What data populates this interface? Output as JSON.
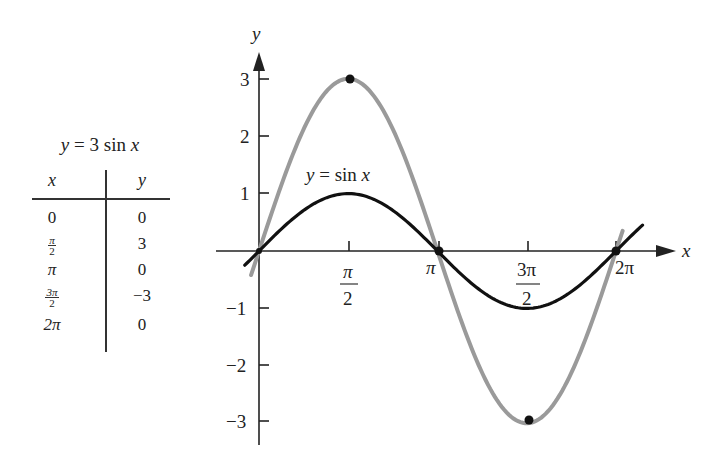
{
  "table": {
    "title": "y = 3 sin x",
    "headers": [
      "x",
      "y"
    ],
    "rows": [
      {
        "x": "0",
        "y": "0"
      },
      {
        "x_num": "π",
        "x_den": "2",
        "y": "3"
      },
      {
        "x": "π",
        "y": "0"
      },
      {
        "x_num": "3π",
        "x_den": "2",
        "y": "−3"
      },
      {
        "x": "2π",
        "y": "0"
      }
    ]
  },
  "graph": {
    "x_axis_label": "x",
    "y_axis_label": "y",
    "curve_label": "y = sin x",
    "x_ticks": [
      {
        "label": "π",
        "den": "2",
        "value": 1.5708
      },
      {
        "label": "π",
        "den": "",
        "value": 3.1416
      },
      {
        "label": "3π",
        "den": "2",
        "value": 4.7124
      },
      {
        "label": "2π",
        "den": "",
        "value": 6.2832
      }
    ],
    "y_ticks": [
      "3",
      "2",
      "1",
      "−1",
      "−2",
      "−3"
    ],
    "colors": {
      "sin": "#111111",
      "three_sin": "#9a9a9a",
      "axis": "#222222"
    }
  },
  "chart_data": {
    "type": "line",
    "title": "",
    "xlabel": "x",
    "ylabel": "y",
    "xlim": [
      -0.25,
      6.8
    ],
    "ylim": [
      -3.4,
      3.9
    ],
    "x_tick_labels": [
      "π/2",
      "π",
      "3π/2",
      "2π"
    ],
    "y_tick_labels": [
      "-3",
      "-2",
      "-1",
      "1",
      "2",
      "3"
    ],
    "grid": false,
    "legend": "none (inline label 'y = sin x')",
    "series": [
      {
        "name": "y = sin x",
        "color": "#111111",
        "x": [
          0,
          1.5708,
          3.1416,
          4.7124,
          6.2832
        ],
        "y": [
          0,
          1,
          0,
          -1,
          0
        ]
      },
      {
        "name": "y = 3 sin x",
        "color": "#9a9a9a",
        "x": [
          0,
          1.5708,
          3.1416,
          4.7124,
          6.2832
        ],
        "y": [
          0,
          3,
          0,
          -3,
          0
        ]
      }
    ],
    "marked_points": [
      {
        "x": 1.5708,
        "y": 3
      },
      {
        "x": 3.1416,
        "y": 0
      },
      {
        "x": 4.7124,
        "y": -3
      },
      {
        "x": 6.2832,
        "y": 0
      },
      {
        "x": 0,
        "y": 0
      }
    ],
    "table": {
      "title": "y = 3 sin x",
      "columns": [
        "x",
        "y"
      ],
      "rows": [
        [
          "0",
          "0"
        ],
        [
          "π/2",
          "3"
        ],
        [
          "π",
          "0"
        ],
        [
          "3π/2",
          "-3"
        ],
        [
          "2π",
          "0"
        ]
      ]
    }
  }
}
